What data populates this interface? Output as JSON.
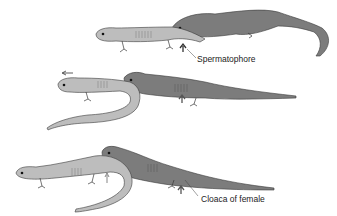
{
  "figure": {
    "type": "salamander courtship / sperm transfer sequence",
    "panels": [
      {
        "id": "panel-1",
        "label": "Spermatophore",
        "male_color": "#bdbdbd",
        "female_color": "#7c7c7c"
      },
      {
        "id": "panel-2",
        "direction_arrow": "left",
        "male_color": "#bdbdbd",
        "female_color": "#7c7c7c"
      },
      {
        "id": "panel-3",
        "label": "Cloaca of female",
        "male_color": "#bdbdbd",
        "female_color": "#7c7c7c"
      }
    ]
  },
  "labels": {
    "spermatophore": "Spermatophore",
    "cloaca": "Cloaca of female"
  },
  "colors": {
    "background": "#ffffff",
    "light_salamander": "#bdbdbd",
    "dark_salamander": "#7c7c7c",
    "outline": "#3a3a3a"
  }
}
